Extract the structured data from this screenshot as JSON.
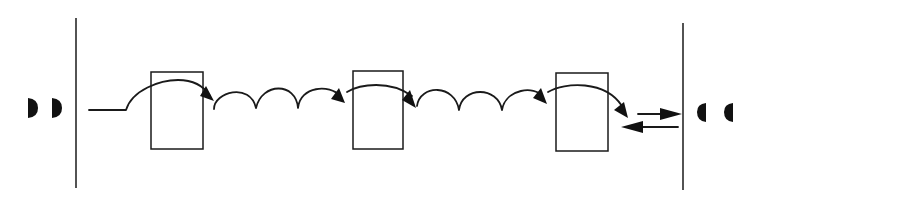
{
  "diagram": {
    "type": "schematic-sequence",
    "colors": {
      "ink": "#1a1a1a",
      "background": "#ffffff"
    },
    "left_boundary": {
      "x": 76,
      "y1": 18,
      "y2": 188
    },
    "right_boundary": {
      "x": 683,
      "y1": 23,
      "y2": 190
    },
    "left_markers": [
      {
        "cx": 29,
        "cy": 108,
        "orientation": "bulge-right"
      },
      {
        "cx": 53,
        "cy": 108,
        "orientation": "bulge-right"
      }
    ],
    "right_markers": [
      {
        "cx": 706,
        "cy": 112,
        "orientation": "bulge-left"
      },
      {
        "cx": 733,
        "cy": 112,
        "orientation": "bulge-left"
      }
    ],
    "boxes": [
      {
        "id": "box-1",
        "x": 151,
        "y": 72,
        "w": 52,
        "h": 77
      },
      {
        "id": "box-2",
        "x": 353,
        "y": 71,
        "w": 50,
        "h": 78
      },
      {
        "id": "box-3",
        "x": 556,
        "y": 73,
        "w": 52,
        "h": 78
      }
    ],
    "loops_between_boxes": 3,
    "end_arrows": [
      {
        "direction": "right",
        "x1": 638,
        "x2": 682,
        "y": 114
      },
      {
        "direction": "left",
        "x1": 678,
        "x2": 621,
        "y": 127
      }
    ]
  }
}
